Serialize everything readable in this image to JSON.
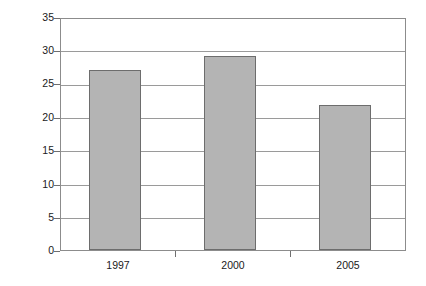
{
  "chart_data": {
    "type": "bar",
    "title": "",
    "xlabel": "",
    "ylabel": "Income (million)",
    "categories": [
      "1997",
      "2000",
      "2005"
    ],
    "values": [
      27.0,
      29.2,
      21.8
    ],
    "series": [
      {
        "name": "Income",
        "values": [
          27.0,
          29.2,
          21.8
        ]
      }
    ],
    "ylim": [
      0,
      35
    ],
    "yticks": [
      0,
      5,
      10,
      15,
      20,
      25,
      30,
      35
    ],
    "ytick_labels": [
      "0",
      "5",
      "10",
      "15",
      "20",
      "25",
      "30",
      "35"
    ],
    "grid": "horizontal",
    "legend": "none",
    "bar_color": "#b4b4b4",
    "bar_border_color": "#6d6d6d",
    "gridline_color": "#9a9a9a",
    "axis_color": "#8c8c8c",
    "background_color": "#ffffff",
    "text_color": "#1a1a1a"
  }
}
